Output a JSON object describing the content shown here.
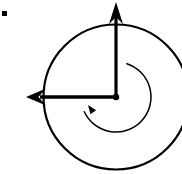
{
  "figure": {
    "title": "Angular velocity vector diagram",
    "canvas": {
      "width": 182,
      "height": 174,
      "background": "#ffffff"
    },
    "colors": {
      "stroke": "#000000",
      "background": "#ffffff"
    },
    "corner_marker": {
      "name": "bullet-marker",
      "shape": "square",
      "x": 2,
      "y": 11,
      "width": 5,
      "height": 5,
      "color": "#000000"
    },
    "outer_circle": {
      "name": "outer-circle",
      "cx": 116,
      "cy": 97,
      "r": 72.5,
      "stroke_width": 2.2,
      "fill": "none"
    },
    "origin": {
      "name": "origin-dot",
      "cx": 116,
      "cy": 97,
      "r": 3.2
    },
    "vectors": [
      {
        "name": "vertical-axis-arrow",
        "direction": "up",
        "from_x": 116,
        "from_y": 97,
        "to_x": 116,
        "to_y": 10,
        "tip_x": 116,
        "tip_y": 2,
        "shaft_width": 3.2,
        "head_half_width": 7,
        "head_length": 22,
        "label": ""
      },
      {
        "name": "horizontal-axis-arrow",
        "direction": "left",
        "from_x": 116,
        "from_y": 97,
        "to_x": 40,
        "to_y": 97,
        "tip_x": 26,
        "tip_y": 97,
        "shaft_width": 3.4,
        "head_half_width": 8.5,
        "head_length": 20,
        "label": ""
      }
    ],
    "rotation_arc": {
      "name": "rotation-direction-arc",
      "sense": "counterclockwise-indicator",
      "cx": 116,
      "cy": 97,
      "r": 35,
      "start_angle_deg": 72,
      "end_angle_deg": 205,
      "sweep": "clockwise-path",
      "stroke_width": 1.5,
      "arrowhead": {
        "name": "arc-arrowhead",
        "x": 88,
        "y": 105,
        "points_toward": "upper-left",
        "size": 9
      }
    }
  }
}
